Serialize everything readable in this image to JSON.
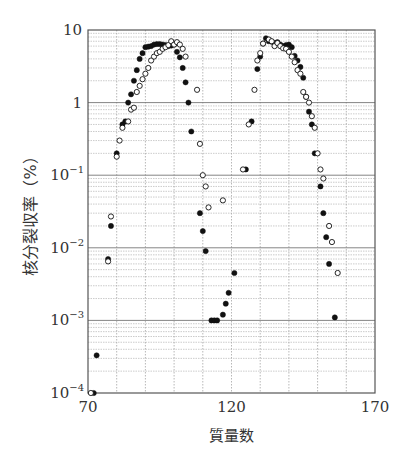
{
  "chart_data": {
    "type": "scatter",
    "title": "",
    "xlabel": "質量数",
    "ylabel": "核分裂収率（%）",
    "xscale": "linear",
    "yscale": "log",
    "xlim": [
      70,
      170
    ],
    "ylim": [
      0.0001,
      10
    ],
    "x_ticks": [
      70,
      120,
      170
    ],
    "x_tick_labels": [
      "70",
      "120",
      "170"
    ],
    "y_ticks": [
      10,
      1,
      0.1,
      0.01,
      0.001,
      0.0001
    ],
    "y_tick_labels": [
      {
        "base": "10",
        "exp": ""
      },
      {
        "base": "1",
        "exp": ""
      },
      {
        "base": "10",
        "exp": "−1"
      },
      {
        "base": "10",
        "exp": "−2"
      },
      {
        "base": "10",
        "exp": "−3"
      },
      {
        "base": "10",
        "exp": "−4"
      }
    ],
    "grid": true,
    "legend": null,
    "series": [
      {
        "name": "filled",
        "marker": "filled-circle",
        "points": [
          [
            72,
            0.0001
          ],
          [
            73,
            0.00033
          ],
          [
            77,
            0.007
          ],
          [
            78,
            0.02
          ],
          [
            80,
            0.2
          ],
          [
            82,
            0.5
          ],
          [
            83,
            0.55
          ],
          [
            84,
            1.0
          ],
          [
            85,
            1.3
          ],
          [
            86,
            2.0
          ],
          [
            87,
            2.8
          ],
          [
            88,
            4.0
          ],
          [
            89,
            4.8
          ],
          [
            90,
            5.8
          ],
          [
            91,
            5.9
          ],
          [
            92,
            6.0
          ],
          [
            93,
            6.3
          ],
          [
            94,
            6.4
          ],
          [
            95,
            6.4
          ],
          [
            96,
            6.3
          ],
          [
            97,
            6.2
          ],
          [
            98,
            6.0
          ],
          [
            99,
            6.1
          ],
          [
            100,
            6.3
          ],
          [
            101,
            5.0
          ],
          [
            102,
            4.2
          ],
          [
            103,
            3.0
          ],
          [
            104,
            1.9
          ],
          [
            105,
            1.0
          ],
          [
            106,
            0.4
          ],
          [
            109,
            0.03
          ],
          [
            110,
            0.017
          ],
          [
            111,
            0.009
          ],
          [
            113,
            0.001
          ],
          [
            114,
            0.001
          ],
          [
            115,
            0.001
          ],
          [
            117,
            0.0012
          ],
          [
            118,
            0.0017
          ],
          [
            119,
            0.0024
          ],
          [
            121,
            0.0045
          ],
          [
            125,
            0.12
          ],
          [
            127,
            0.55
          ],
          [
            129,
            2.9
          ],
          [
            130,
            4.3
          ],
          [
            131,
            6.5
          ],
          [
            132,
            7.7
          ],
          [
            133,
            7.0
          ],
          [
            134,
            6.9
          ],
          [
            135,
            6.6
          ],
          [
            136,
            6.8
          ],
          [
            137,
            6.3
          ],
          [
            138,
            6.0
          ],
          [
            139,
            6.2
          ],
          [
            140,
            6.3
          ],
          [
            141,
            5.8
          ],
          [
            142,
            4.4
          ],
          [
            143,
            3.8
          ],
          [
            144,
            3.1
          ],
          [
            145,
            2.2
          ],
          [
            146,
            1.2
          ],
          [
            147,
            0.75
          ],
          [
            148,
            0.5
          ],
          [
            149,
            0.2
          ],
          [
            151,
            0.07
          ],
          [
            152,
            0.03
          ],
          [
            153,
            0.014
          ],
          [
            154,
            0.006
          ],
          [
            156,
            0.0011
          ]
        ]
      },
      {
        "name": "open",
        "marker": "open-circle",
        "points": [
          [
            71,
            0.0001
          ],
          [
            77,
            0.0065
          ],
          [
            78,
            0.027
          ],
          [
            80,
            0.18
          ],
          [
            81,
            0.3
          ],
          [
            82,
            0.45
          ],
          [
            84,
            0.55
          ],
          [
            85,
            0.8
          ],
          [
            86,
            0.85
          ],
          [
            87,
            1.4
          ],
          [
            88,
            1.7
          ],
          [
            89,
            2.1
          ],
          [
            90,
            2.5
          ],
          [
            91,
            3.0
          ],
          [
            92,
            3.8
          ],
          [
            93,
            4.3
          ],
          [
            94,
            4.8
          ],
          [
            95,
            5.0
          ],
          [
            96,
            5.5
          ],
          [
            97,
            5.8
          ],
          [
            98,
            6.2
          ],
          [
            99,
            7.0
          ],
          [
            100,
            6.3
          ],
          [
            101,
            6.8
          ],
          [
            102,
            6.3
          ],
          [
            103,
            5.5
          ],
          [
            104,
            4.3
          ],
          [
            108,
            1.5
          ],
          [
            109,
            0.27
          ],
          [
            110,
            0.1
          ],
          [
            111,
            0.07
          ],
          [
            112,
            0.036
          ],
          [
            117,
            0.045
          ],
          [
            124,
            0.12
          ],
          [
            126,
            0.5
          ],
          [
            128,
            1.5
          ],
          [
            129,
            3.8
          ],
          [
            130,
            4.8
          ],
          [
            131,
            6.5
          ],
          [
            133,
            7.4
          ],
          [
            134,
            7.0
          ],
          [
            135,
            6.0
          ],
          [
            136,
            6.6
          ],
          [
            137,
            6.0
          ],
          [
            138,
            5.6
          ],
          [
            139,
            5.5
          ],
          [
            140,
            5.0
          ],
          [
            141,
            4.3
          ],
          [
            142,
            3.6
          ],
          [
            143,
            2.8
          ],
          [
            144,
            2.5
          ],
          [
            145,
            1.4
          ],
          [
            146,
            1.2
          ],
          [
            147,
            1.0
          ],
          [
            148,
            0.65
          ],
          [
            149,
            0.45
          ],
          [
            150,
            0.2
          ],
          [
            151,
            0.12
          ],
          [
            152,
            0.09
          ],
          [
            154,
            0.02
          ],
          [
            155,
            0.012
          ],
          [
            157,
            0.0045
          ]
        ]
      }
    ]
  }
}
